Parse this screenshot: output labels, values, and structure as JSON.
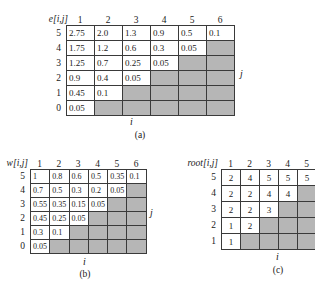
{
  "figure": {
    "shade_color": "#b6b6b6",
    "grid_line_color": "#3a3a3a",
    "background": "#ffffff"
  },
  "panels": [
    {
      "id": "a",
      "caption": "(a)",
      "corner_label": "e[i,j]",
      "axis_x_label": "i",
      "axis_y_label": "j",
      "col_headers": [
        "1",
        "2",
        "3",
        "4",
        "5",
        "6"
      ],
      "row_headers": [
        "5",
        "4",
        "3",
        "2",
        "1",
        "0"
      ],
      "align": "left",
      "rows": [
        [
          "2.75",
          "2.0",
          "1.3",
          "0.9",
          "0.5",
          "0.1"
        ],
        [
          "1.75",
          "1.2",
          "0.6",
          "0.3",
          "0.05",
          ""
        ],
        [
          "1.25",
          "0.7",
          "0.25",
          "0.05",
          "",
          ""
        ],
        [
          "0.9",
          "0.4",
          "0.05",
          "",
          "",
          ""
        ],
        [
          "0.45",
          "0.1",
          "",
          "",
          "",
          ""
        ],
        [
          "0.05",
          "",
          "",
          "",
          "",
          ""
        ]
      ]
    },
    {
      "id": "b",
      "caption": "(b)",
      "corner_label": "w[i,j]",
      "axis_x_label": "i",
      "axis_y_label": "j",
      "col_headers": [
        "1",
        "2",
        "3",
        "4",
        "5",
        "6"
      ],
      "row_headers": [
        "5",
        "4",
        "3",
        "2",
        "1",
        "0"
      ],
      "align": "left",
      "rows": [
        [
          "1",
          "0.8",
          "0.6",
          "0.5",
          "0.35",
          "0.1"
        ],
        [
          "0.7",
          "0.5",
          "0.3",
          "0.2",
          "0.05",
          ""
        ],
        [
          "0.55",
          "0.35",
          "0.15",
          "0.05",
          "",
          ""
        ],
        [
          "0.45",
          "0.25",
          "0.05",
          "",
          "",
          ""
        ],
        [
          "0.3",
          "0.1",
          "",
          "",
          "",
          ""
        ],
        [
          "0.05",
          "",
          "",
          "",
          "",
          ""
        ]
      ]
    },
    {
      "id": "c",
      "caption": "(c)",
      "corner_label": "root[i,j]",
      "axis_x_label": "i",
      "axis_y_label": "j",
      "col_headers": [
        "1",
        "2",
        "3",
        "4",
        "5"
      ],
      "row_headers": [
        "5",
        "4",
        "3",
        "2",
        "1"
      ],
      "align": "center",
      "rows": [
        [
          "2",
          "4",
          "5",
          "5",
          "5"
        ],
        [
          "2",
          "2",
          "4",
          "4",
          ""
        ],
        [
          "2",
          "2",
          "3",
          "",
          ""
        ],
        [
          "1",
          "2",
          "",
          "",
          ""
        ],
        [
          "1",
          "",
          "",
          "",
          ""
        ]
      ]
    }
  ]
}
